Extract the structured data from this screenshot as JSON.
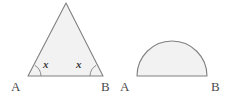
{
  "figure": {
    "background_color": "#ffffff",
    "stroke_color": "#808080",
    "fill_color": "#f2f2f2",
    "label_color": "#4a4a4a",
    "angle_label_color": "#3c3c3c"
  },
  "shapes": {
    "triangle": {
      "name": "isosceles-triangle",
      "apex": {
        "x": 66,
        "y": 3
      },
      "base_left": {
        "x": 28,
        "y": 76
      },
      "base_right": {
        "x": 103,
        "y": 76
      },
      "left_vertex_label": "A",
      "right_vertex_label": "B",
      "left_angle_label": "x",
      "right_angle_label": "x"
    },
    "semicircle": {
      "name": "semicircle",
      "base_left": {
        "x": 137,
        "y": 76
      },
      "base_right": {
        "x": 207,
        "y": 76
      },
      "center": {
        "x": 172,
        "y": 76
      },
      "radius": 35,
      "left_vertex_label": "A",
      "right_vertex_label": "B"
    }
  }
}
